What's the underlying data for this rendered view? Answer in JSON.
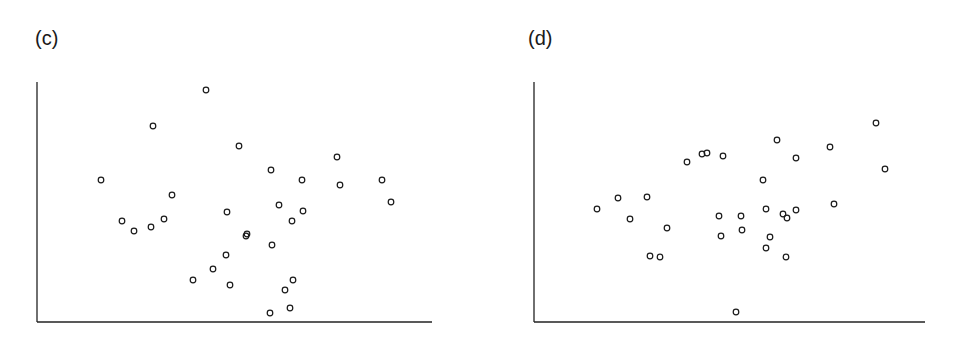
{
  "panels": [
    {
      "label": "(c)"
    },
    {
      "label": "(d)"
    }
  ],
  "chart_data": [
    {
      "type": "scatter",
      "title": "(c)",
      "xlabel": "",
      "ylabel": "",
      "grid": false,
      "legend": null,
      "note": "Unlabeled axes; values are in relative pixel units (x from y-axis, y up from x-axis), axis box approx 395 wide x 240 tall.",
      "xlim": [
        0,
        395
      ],
      "ylim": [
        0,
        240
      ],
      "points": [
        [
          64,
          142
        ],
        [
          116,
          196
        ],
        [
          169,
          232
        ],
        [
          202,
          176
        ],
        [
          234,
          152
        ],
        [
          265,
          142
        ],
        [
          300,
          165
        ],
        [
          303,
          137
        ],
        [
          345,
          142
        ],
        [
          354,
          120
        ],
        [
          135,
          127
        ],
        [
          190,
          110
        ],
        [
          242,
          117
        ],
        [
          266,
          111
        ],
        [
          255,
          101
        ],
        [
          127,
          103
        ],
        [
          85,
          101
        ],
        [
          97,
          91
        ],
        [
          114,
          95
        ],
        [
          210,
          88
        ],
        [
          209,
          86
        ],
        [
          235,
          77
        ],
        [
          189,
          67
        ],
        [
          176,
          53
        ],
        [
          156,
          42
        ],
        [
          193,
          37
        ],
        [
          256,
          42
        ],
        [
          248,
          32
        ],
        [
          253,
          14
        ],
        [
          233,
          9
        ]
      ],
      "marker": "open-circle",
      "color": "#1a1a1a"
    },
    {
      "type": "scatter",
      "title": "(d)",
      "xlabel": "",
      "ylabel": "",
      "grid": false,
      "legend": null,
      "note": "Unlabeled axes; values are in relative pixel units (x from y-axis, y up from x-axis), axis box approx 391 wide x 240 tall.",
      "xlim": [
        0,
        391
      ],
      "ylim": [
        0,
        240
      ],
      "points": [
        [
          63,
          113
        ],
        [
          84,
          124
        ],
        [
          96,
          103
        ],
        [
          113,
          125
        ],
        [
          133,
          94
        ],
        [
          116,
          66
        ],
        [
          126,
          65
        ],
        [
          153,
          160
        ],
        [
          168,
          168
        ],
        [
          173,
          169
        ],
        [
          189,
          166
        ],
        [
          185,
          106
        ],
        [
          187,
          86
        ],
        [
          207,
          106
        ],
        [
          208,
          92
        ],
        [
          229,
          142
        ],
        [
          243,
          182
        ],
        [
          232,
          113
        ],
        [
          236,
          85
        ],
        [
          232,
          74
        ],
        [
          253,
          104
        ],
        [
          249,
          108
        ],
        [
          262,
          112
        ],
        [
          262,
          164
        ],
        [
          296,
          175
        ],
        [
          300,
          118
        ],
        [
          342,
          199
        ],
        [
          351,
          153
        ],
        [
          252,
          65
        ],
        [
          202,
          10
        ]
      ],
      "marker": "open-circle",
      "color": "#1a1a1a"
    }
  ]
}
